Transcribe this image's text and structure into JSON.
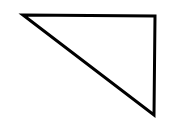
{
  "diagram": {
    "shape": "right-triangle",
    "background": "#ffffff",
    "stroke": "#000000",
    "stroke_width": 3,
    "fill": "none",
    "vertices": [
      {
        "x": 23,
        "y": 15
      },
      {
        "x": 155,
        "y": 16
      },
      {
        "x": 154,
        "y": 115
      }
    ]
  }
}
